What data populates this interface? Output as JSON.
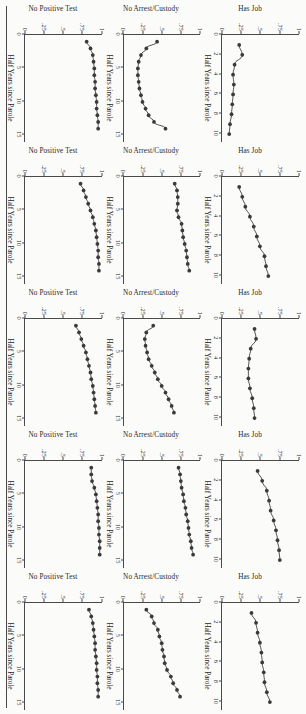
{
  "figure": {
    "orientation_note": "scanned-sideways",
    "rows": 3,
    "columns": 5,
    "rule_color": "#4a4a4a",
    "point_color": "#3a3a3a",
    "line_color": "#3a3a3a"
  },
  "axes": {
    "ylabel_hasjob": "Has Job",
    "ylabel_noarrest": "No Arrest/Custody",
    "ylabel_nopos": "No Positive Test",
    "xlabel": "Half Years since Parole",
    "yticks": [
      "0",
      ".25",
      ".5",
      ".75",
      "1"
    ],
    "yvalues": [
      0,
      0.25,
      0.5,
      0.75,
      1
    ],
    "xticks_10": [
      "0",
      "2",
      "4",
      "6",
      "8",
      "10"
    ],
    "xvalues_10": [
      0,
      2,
      4,
      6,
      8,
      10
    ],
    "xticks_15": [
      "0",
      "5",
      "10",
      "15"
    ],
    "xvalues_15": [
      0,
      5,
      10,
      15
    ]
  },
  "chart_data": [
    {
      "id": "r1c1",
      "type": "scatter",
      "title": "",
      "ylabel": "Has Job",
      "xlabel": "Half Years since Parole",
      "ylim": [
        0,
        1
      ],
      "xlim": [
        0,
        10.8
      ],
      "xticks": [
        0,
        2,
        4,
        6,
        8,
        10
      ],
      "yticks": [
        0,
        0.25,
        0.5,
        0.75,
        1
      ],
      "grid": false,
      "x": [
        1,
        2,
        3,
        4,
        5,
        6,
        7,
        8,
        9,
        10
      ],
      "y": [
        0.22,
        0.26,
        0.16,
        0.14,
        0.15,
        0.14,
        0.13,
        0.12,
        0.1,
        0.09
      ]
    },
    {
      "id": "r2c1",
      "type": "scatter",
      "ylabel": "No Arrest/Custody",
      "xlabel": "Half Years since Parole",
      "ylim": [
        0,
        1
      ],
      "xlim": [
        0,
        16
      ],
      "xticks": [
        0,
        5,
        10,
        15
      ],
      "yticks": [
        0,
        0.25,
        0.5,
        0.75,
        1
      ],
      "grid": false,
      "x": [
        1,
        2,
        3,
        4,
        5,
        6,
        7,
        8,
        9,
        10,
        11,
        12,
        13,
        14
      ],
      "y": [
        0.44,
        0.3,
        0.23,
        0.2,
        0.19,
        0.19,
        0.2,
        0.21,
        0.23,
        0.25,
        0.29,
        0.33,
        0.4,
        0.55
      ]
    },
    {
      "id": "r3c1",
      "type": "scatter",
      "ylabel": "No Positive Test",
      "xlabel": "Half Years since Parole",
      "ylim": [
        0,
        1
      ],
      "xlim": [
        0,
        16
      ],
      "xticks": [
        0,
        5,
        10,
        15
      ],
      "yticks": [
        0,
        0.25,
        0.5,
        0.75,
        1
      ],
      "grid": false,
      "x": [
        1,
        2,
        3,
        4,
        5,
        6,
        7,
        8,
        9,
        10,
        11,
        12,
        13,
        14
      ],
      "y": [
        0.8,
        0.85,
        0.88,
        0.89,
        0.9,
        0.9,
        0.91,
        0.91,
        0.92,
        0.93,
        0.93,
        0.94,
        0.95,
        0.95
      ]
    },
    {
      "id": "r1c2",
      "type": "scatter",
      "ylabel": "Has Job",
      "xlabel": "Half Years since Parole",
      "ylim": [
        0,
        1
      ],
      "xlim": [
        0,
        10.8
      ],
      "xticks": [
        0,
        2,
        4,
        6,
        8,
        10
      ],
      "yticks": [
        0,
        0.25,
        0.5,
        0.75,
        1
      ],
      "grid": false,
      "x": [
        1,
        2,
        3,
        4,
        5,
        6,
        7,
        8,
        9,
        10
      ],
      "y": [
        0.22,
        0.26,
        0.3,
        0.36,
        0.41,
        0.45,
        0.49,
        0.55,
        0.57,
        0.6
      ]
    },
    {
      "id": "r2c2",
      "type": "scatter",
      "ylabel": "No Arrest/Custody",
      "xlabel": "Half Years since Parole",
      "ylim": [
        0,
        1
      ],
      "xlim": [
        0,
        16
      ],
      "xticks": [
        0,
        5,
        10,
        15
      ],
      "yticks": [
        0,
        0.25,
        0.5,
        0.75,
        1
      ],
      "grid": false,
      "x": [
        1,
        2,
        3,
        4,
        5,
        6,
        7,
        8,
        9,
        10,
        11,
        12,
        13,
        14
      ],
      "y": [
        0.67,
        0.7,
        0.71,
        0.71,
        0.7,
        0.72,
        0.76,
        0.77,
        0.78,
        0.8,
        0.82,
        0.83,
        0.84,
        0.86
      ]
    },
    {
      "id": "r3c2",
      "type": "scatter",
      "ylabel": "No Positive Test",
      "xlabel": "Half Years since Parole",
      "ylim": [
        0,
        1
      ],
      "xlim": [
        0,
        16
      ],
      "xticks": [
        0,
        5,
        10,
        15
      ],
      "yticks": [
        0,
        0.25,
        0.5,
        0.75,
        1
      ],
      "grid": false,
      "x": [
        1,
        2,
        3,
        4,
        5,
        6,
        7,
        8,
        9,
        10,
        11,
        12,
        13,
        14
      ],
      "y": [
        0.72,
        0.76,
        0.79,
        0.82,
        0.85,
        0.88,
        0.9,
        0.92,
        0.93,
        0.94,
        0.95,
        0.95,
        0.96,
        0.96
      ]
    },
    {
      "id": "r1c3",
      "type": "scatter",
      "ylabel": "Has Job",
      "xlabel": "Half Years since Parole",
      "ylim": [
        0,
        1
      ],
      "xlim": [
        0,
        10.8
      ],
      "xticks": [
        0,
        2,
        4,
        6,
        8,
        10
      ],
      "yticks": [
        0,
        0.25,
        0.5,
        0.75,
        1
      ],
      "grid": false,
      "x": [
        1,
        2,
        3,
        4,
        5,
        6,
        7,
        8,
        9,
        10
      ],
      "y": [
        0.42,
        0.44,
        0.37,
        0.35,
        0.34,
        0.34,
        0.36,
        0.39,
        0.41,
        0.42
      ]
    },
    {
      "id": "r2c3",
      "type": "scatter",
      "ylabel": "No Arrest/Custody",
      "xlabel": "Half Years since Parole",
      "ylim": [
        0,
        1
      ],
      "xlim": [
        0,
        16
      ],
      "xticks": [
        0,
        5,
        10,
        15
      ],
      "yticks": [
        0,
        0.25,
        0.5,
        0.75,
        1
      ],
      "grid": false,
      "x": [
        1,
        2,
        3,
        4,
        5,
        6,
        7,
        8,
        9,
        10,
        11,
        12,
        13,
        14
      ],
      "y": [
        0.39,
        0.3,
        0.28,
        0.29,
        0.31,
        0.33,
        0.37,
        0.41,
        0.45,
        0.5,
        0.55,
        0.59,
        0.63,
        0.66
      ]
    },
    {
      "id": "r3c3",
      "type": "scatter",
      "ylabel": "No Positive Test",
      "xlabel": "Half Years since Parole",
      "ylim": [
        0,
        1
      ],
      "xlim": [
        0,
        16
      ],
      "xticks": [
        0,
        5,
        10,
        15
      ],
      "yticks": [
        0,
        0.25,
        0.5,
        0.75,
        1
      ],
      "grid": false,
      "x": [
        1,
        2,
        3,
        4,
        5,
        6,
        7,
        8,
        9,
        10,
        11,
        12,
        13,
        14
      ],
      "y": [
        0.66,
        0.7,
        0.73,
        0.76,
        0.79,
        0.81,
        0.83,
        0.85,
        0.86,
        0.88,
        0.89,
        0.9,
        0.91,
        0.92
      ]
    },
    {
      "id": "r1c4",
      "type": "scatter",
      "ylabel": "Has Job",
      "xlabel": "Half Years since Parole",
      "ylim": [
        0,
        1
      ],
      "xlim": [
        0,
        10.8
      ],
      "xticks": [
        0,
        2,
        4,
        6,
        8,
        10
      ],
      "yticks": [
        0,
        0.25,
        0.5,
        0.75,
        1
      ],
      "grid": false,
      "x": [
        1,
        2,
        3,
        4,
        5,
        6,
        7,
        8,
        9,
        10
      ],
      "y": [
        0.46,
        0.52,
        0.58,
        0.61,
        0.63,
        0.67,
        0.7,
        0.72,
        0.74,
        0.75
      ]
    },
    {
      "id": "r2c4",
      "type": "scatter",
      "ylabel": "No Arrest/Custody",
      "xlabel": "Half Years since Parole",
      "ylim": [
        0,
        1
      ],
      "xlim": [
        0,
        16
      ],
      "xticks": [
        0,
        5,
        10,
        15
      ],
      "yticks": [
        0,
        0.25,
        0.5,
        0.75,
        1
      ],
      "grid": false,
      "x": [
        1,
        2,
        3,
        4,
        5,
        6,
        7,
        8,
        9,
        10,
        11,
        12,
        13,
        14
      ],
      "y": [
        0.72,
        0.74,
        0.75,
        0.76,
        0.78,
        0.79,
        0.81,
        0.82,
        0.84,
        0.85,
        0.86,
        0.88,
        0.89,
        0.91
      ]
    },
    {
      "id": "r3c4",
      "type": "scatter",
      "ylabel": "No Positive Test",
      "xlabel": "Half Years since Parole",
      "ylim": [
        0,
        1
      ],
      "xlim": [
        0,
        16
      ],
      "xticks": [
        0,
        5,
        10,
        15
      ],
      "yticks": [
        0,
        0.25,
        0.5,
        0.75,
        1
      ],
      "grid": false,
      "x": [
        1,
        2,
        3,
        4,
        5,
        6,
        7,
        8,
        9,
        10,
        11,
        12,
        13,
        14
      ],
      "y": [
        0.86,
        0.86,
        0.87,
        0.9,
        0.92,
        0.93,
        0.94,
        0.95,
        0.95,
        0.96,
        0.96,
        0.97,
        0.97,
        0.97
      ]
    },
    {
      "id": "r1c5",
      "type": "scatter",
      "ylabel": "Has Job",
      "xlabel": "Half Years since Parole",
      "ylim": [
        0,
        1
      ],
      "xlim": [
        0,
        10.8
      ],
      "xticks": [
        0,
        2,
        4,
        6,
        8,
        10
      ],
      "yticks": [
        0,
        0.25,
        0.5,
        0.75,
        1
      ],
      "grid": false,
      "x": [
        1,
        2,
        3,
        4,
        5,
        6,
        7,
        8,
        9,
        10
      ],
      "y": [
        0.38,
        0.44,
        0.46,
        0.49,
        0.51,
        0.52,
        0.54,
        0.55,
        0.58,
        0.62
      ]
    },
    {
      "id": "r2c5",
      "type": "scatter",
      "ylabel": "No Arrest/Custody",
      "xlabel": "Half Years since Parole",
      "ylim": [
        0,
        1
      ],
      "xlim": [
        0,
        16
      ],
      "xticks": [
        0,
        5,
        10,
        15
      ],
      "yticks": [
        0,
        0.25,
        0.5,
        0.75,
        1
      ],
      "grid": false,
      "x": [
        1,
        2,
        3,
        4,
        5,
        6,
        7,
        8,
        9,
        10,
        11,
        12,
        13,
        14
      ],
      "y": [
        0.3,
        0.37,
        0.4,
        0.45,
        0.47,
        0.5,
        0.51,
        0.53,
        0.54,
        0.57,
        0.62,
        0.65,
        0.7,
        0.74
      ]
    },
    {
      "id": "r3c5",
      "type": "scatter",
      "ylabel": "No Positive Test",
      "xlabel": "Half Years since Parole",
      "ylim": [
        0,
        1
      ],
      "xlim": [
        0,
        16
      ],
      "xticks": [
        0,
        5,
        10,
        15
      ],
      "yticks": [
        0,
        0.25,
        0.5,
        0.75,
        1
      ],
      "grid": false,
      "x": [
        1,
        2,
        3,
        4,
        5,
        6,
        7,
        8,
        9,
        10,
        11,
        12,
        13,
        14
      ],
      "y": [
        0.83,
        0.86,
        0.88,
        0.89,
        0.9,
        0.91,
        0.91,
        0.92,
        0.93,
        0.93,
        0.94,
        0.94,
        0.95,
        0.95
      ]
    }
  ]
}
